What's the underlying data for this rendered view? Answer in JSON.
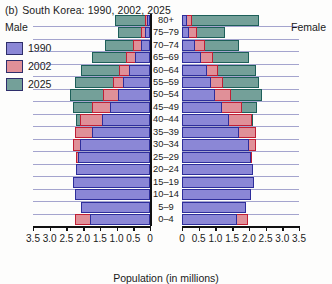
{
  "title": {
    "tag": "(b)",
    "text": "South Korea: 1990, 2002, 2025"
  },
  "labels": {
    "male": "Male",
    "female": "Female"
  },
  "legend": [
    {
      "label": "1990",
      "color": "#8b87d6"
    },
    {
      "label": "2002",
      "color": "#e09098"
    },
    {
      "label": "2025",
      "color": "#74a099"
    }
  ],
  "chart_data": {
    "type": "bar",
    "subtype": "population-pyramid",
    "xlabel": "Population (in millions)",
    "ylabel": "",
    "grid": true,
    "legend_position": "top-left",
    "sides": [
      "Male",
      "Female"
    ],
    "xlim": [
      0,
      3.5
    ],
    "xticks": [
      0,
      0.5,
      1.0,
      1.5,
      2.0,
      2.5,
      3.0,
      3.5
    ],
    "xtick_labels_left": [
      "3.5",
      "3.0",
      "2.5",
      "2.0",
      "1.5",
      "1.0",
      "0.5",
      "0"
    ],
    "xtick_labels_right": [
      "0",
      "0.5",
      "1.0",
      "1.5",
      "2.0",
      "2.5",
      "3.0",
      "3.5"
    ],
    "categories": [
      "0-4",
      "5-9",
      "10-14",
      "15-19",
      "20-24",
      "25-29",
      "30-34",
      "35-39",
      "40-44",
      "45-49",
      "50-54",
      "55-59",
      "60-64",
      "65-69",
      "70-74",
      "75-79",
      "80+"
    ],
    "series": [
      {
        "name": "1990",
        "color": "#8b87d6",
        "male": [
          1.8,
          2.05,
          2.25,
          2.3,
          2.2,
          2.15,
          2.1,
          1.75,
          1.45,
          1.2,
          0.95,
          0.8,
          0.62,
          0.45,
          0.28,
          0.14,
          0.08
        ],
        "female": [
          1.66,
          1.9,
          2.06,
          2.14,
          2.12,
          2.05,
          2.0,
          1.7,
          1.42,
          1.2,
          1.0,
          0.88,
          0.75,
          0.58,
          0.38,
          0.22,
          0.14
        ]
      },
      {
        "name": "2002",
        "color": "#e09098",
        "male": [
          2.25,
          1.8,
          1.7,
          2.05,
          2.1,
          2.2,
          2.3,
          2.25,
          2.1,
          1.75,
          1.4,
          1.1,
          0.92,
          0.72,
          0.5,
          0.28,
          0.14
        ],
        "female": [
          1.98,
          1.7,
          1.62,
          1.92,
          2.0,
          2.1,
          2.22,
          2.22,
          2.1,
          1.78,
          1.48,
          1.22,
          1.08,
          0.92,
          0.7,
          0.45,
          0.3
        ]
      },
      {
        "name": "2025",
        "color": "#74a099",
        "male": [
          1.8,
          1.9,
          2.0,
          2.05,
          2.05,
          2.0,
          1.95,
          2.05,
          2.22,
          2.3,
          2.4,
          2.25,
          2.05,
          1.75,
          1.35,
          0.95,
          1.05
        ],
        "female": [
          1.68,
          1.78,
          1.88,
          1.92,
          1.92,
          1.9,
          1.86,
          1.96,
          2.12,
          2.25,
          2.38,
          2.3,
          2.2,
          2.0,
          1.7,
          1.3,
          2.3
        ]
      }
    ]
  }
}
